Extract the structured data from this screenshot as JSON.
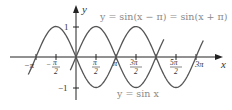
{
  "chart_data": {
    "type": "line",
    "title": "",
    "xlabel": "x",
    "ylabel": "y",
    "xlim": [
      -3.5,
      9.9
    ],
    "ylim": [
      -1.25,
      1.25
    ],
    "grid": false,
    "x_ticks": [
      "−π",
      "−π/2",
      "π/2",
      "π",
      "3π/2",
      "5π/2",
      "3π"
    ],
    "x_tick_values": [
      -3.14159,
      -1.5708,
      1.5708,
      3.14159,
      4.7124,
      7.854,
      9.4248
    ],
    "y_ticks": [
      "1",
      "−1"
    ],
    "y_tick_values": [
      1,
      -1
    ],
    "series": [
      {
        "name": "y = sin x",
        "function": "sin(x)",
        "domain": [
          -0.45,
          6.9
        ],
        "color": "#555555",
        "x": [
          0,
          1.5708,
          3.14159,
          4.7124,
          6.2832
        ],
        "y": [
          0,
          1,
          0,
          -1,
          0
        ]
      },
      {
        "name": "y = sin(x − π) = sin(x + π)",
        "function": "-sin(x)",
        "domain": [
          -3.75,
          10.0
        ],
        "color": "#555555",
        "x": [
          -3.14159,
          -1.5708,
          0,
          1.5708,
          3.14159,
          4.7124,
          6.2832,
          7.854,
          9.4248
        ],
        "y": [
          0,
          -1,
          0,
          -1,
          0,
          1,
          0,
          -1,
          0
        ]
      }
    ],
    "annotations": [
      {
        "text": "y = sin(x − π) = sin(x + π)",
        "near": "top-right"
      },
      {
        "text": "y = sin x",
        "near": "bottom-center"
      }
    ]
  },
  "labels": {
    "y_axis": "y",
    "x_axis": "x",
    "top_formula": "y = sin(x − π) = sin(x + π)",
    "bottom_formula": "y = sin x",
    "y_one": "1",
    "y_neg_one": "−1"
  }
}
